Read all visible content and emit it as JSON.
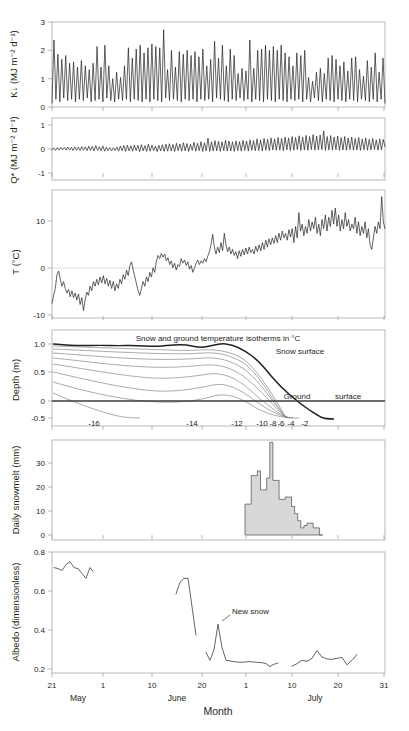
{
  "figure": {
    "xaxis": {
      "title": "Month",
      "ticks": [
        {
          "label": "21",
          "x": 52
        },
        {
          "label": "1",
          "x": 103
        },
        {
          "label": "10",
          "x": 152
        },
        {
          "label": "20",
          "x": 202
        },
        {
          "label": "1",
          "x": 246
        },
        {
          "label": "10",
          "x": 292
        },
        {
          "label": "20",
          "x": 338
        },
        {
          "label": "31",
          "x": 384
        }
      ],
      "months": [
        {
          "label": "May",
          "x": 78
        },
        {
          "label": "June",
          "x": 177
        },
        {
          "label": "July",
          "x": 315
        }
      ]
    },
    "panels": [
      {
        "id": "shortwave",
        "ylabel": "K↓ (MJ m⁻² d⁻¹)",
        "yticks": [
          "0",
          "1",
          "2",
          "3"
        ]
      },
      {
        "id": "netradiation",
        "ylabel": "Q* (MJ m⁻² d⁻¹)",
        "yticks": [
          "-1",
          "0",
          "1"
        ]
      },
      {
        "id": "airtemperature",
        "ylabel": "T (°C)",
        "yticks": [
          "-10",
          "0",
          "10"
        ]
      },
      {
        "id": "depth-isotherms",
        "ylabel": "Depth (m)",
        "yticks": [
          "-0.5",
          "0",
          "0.5",
          "1.0"
        ],
        "caption": "Snow and ground temperature isotherms in °C",
        "labels": {
          "snow_surface": "Snow surface",
          "ground": "Ground",
          "surface": "surface"
        },
        "isotherm_labels": [
          "-16",
          "-14",
          "-12",
          "-10",
          "-8",
          "-6",
          "-4",
          "-2"
        ]
      },
      {
        "id": "snowmelt",
        "ylabel": "Daily snowmelt (mm)",
        "yticks": [
          "0",
          "10",
          "20",
          "30"
        ]
      },
      {
        "id": "albedo",
        "ylabel": "Albedo (dimensionless)",
        "yticks": [
          "0.2",
          "0.4",
          "0.6",
          "0.8"
        ],
        "annotation": "New snow"
      }
    ]
  },
  "chart_data": [
    {
      "type": "line",
      "id": "shortwave",
      "title": "",
      "ylabel": "K↓ (MJ m⁻² d⁻¹)",
      "xlabel": "Month",
      "ylim": [
        0,
        3.3
      ],
      "yticks": [
        0,
        1,
        2,
        3
      ],
      "grid": false,
      "values": [
        0.15,
        2.6,
        0.3,
        2.05,
        0.2,
        1.85,
        0.35,
        2.0,
        0.25,
        1.7,
        0.3,
        1.75,
        0.2,
        1.55,
        0.3,
        1.8,
        0.25,
        1.6,
        0.35,
        1.45,
        0.2,
        1.7,
        0.25,
        2.35,
        0.3,
        1.55,
        0.2,
        2.4,
        0.35,
        1.6,
        0.25,
        1.1,
        0.2,
        1.35,
        0.3,
        1.15,
        0.25,
        1.6,
        0.3,
        2.3,
        0.2,
        1.9,
        0.3,
        2.25,
        0.25,
        2.4,
        0.2,
        2.1,
        0.3,
        2.3,
        0.2,
        2.45,
        0.3,
        2.35,
        0.25,
        2.3,
        0.2,
        3.0,
        0.35,
        1.45,
        0.25,
        2.2,
        0.3,
        1.55,
        0.25,
        2.15,
        0.2,
        2.05,
        0.3,
        2.2,
        0.25,
        2.0,
        0.3,
        2.15,
        0.2,
        1.95,
        0.3,
        2.25,
        0.25,
        1.6,
        0.3,
        1.85,
        0.2,
        2.55,
        0.35,
        1.9,
        0.3,
        2.4,
        0.25,
        1.6,
        0.2,
        2.25,
        0.3,
        2.0,
        0.25,
        1.3,
        0.35,
        1.5,
        0.25,
        1.4,
        0.3,
        2.6,
        0.2,
        1.5,
        0.3,
        2.2,
        0.25,
        2.25,
        0.2,
        2.4,
        0.3,
        2.2,
        0.25,
        2.35,
        0.2,
        2.2,
        0.3,
        2.4,
        0.25,
        2.1,
        0.2,
        1.95,
        0.3,
        1.6,
        0.25,
        2.1,
        0.3,
        2.0,
        0.2,
        2.2,
        0.3,
        1.15,
        0.2,
        1.0,
        0.35,
        1.35,
        0.25,
        1.5,
        0.2,
        1.3,
        0.3,
        1.9,
        0.25,
        2.0,
        0.2,
        1.85,
        0.3,
        1.6,
        0.25,
        1.75,
        0.2,
        1.4,
        0.3,
        1.9,
        0.25,
        1.95,
        0.2,
        1.45,
        0.3,
        1.2,
        0.25,
        1.8,
        0.2,
        1.55,
        0.3,
        2.1,
        0.2,
        1.35,
        0.3,
        1.9,
        0.15
      ],
      "xrange_px": [
        52,
        385
      ]
    },
    {
      "type": "line",
      "id": "netradiation",
      "ylabel": "Q* (MJ m⁻² d⁻¹)",
      "xlabel": "Month",
      "ylim": [
        -1,
        1
      ],
      "yticks": [
        -1,
        0,
        1
      ],
      "grid": false,
      "values": [
        -0.04,
        0.05,
        -0.06,
        0.06,
        -0.05,
        0.07,
        -0.04,
        0.06,
        -0.05,
        0.08,
        -0.05,
        0.07,
        -0.06,
        0.09,
        -0.05,
        0.08,
        -0.06,
        0.1,
        -0.05,
        0.09,
        -0.07,
        0.12,
        -0.06,
        0.11,
        -0.08,
        0.14,
        -0.06,
        0.1,
        -0.07,
        0.13,
        -0.09,
        0.08,
        -0.07,
        0.06,
        -0.08,
        0.05,
        -0.06,
        0.08,
        -0.09,
        0.12,
        -0.07,
        0.14,
        -0.1,
        0.16,
        -0.08,
        0.13,
        -0.09,
        0.17,
        -0.07,
        0.15,
        -0.11,
        0.18,
        -0.08,
        0.14,
        -0.1,
        0.2,
        -0.09,
        0.16,
        -0.07,
        0.12,
        -0.11,
        0.15,
        -0.08,
        0.18,
        -0.1,
        0.2,
        -0.09,
        0.22,
        -0.08,
        0.19,
        -0.1,
        0.24,
        -0.07,
        0.21,
        -0.09,
        0.26,
        -0.08,
        0.23,
        -0.1,
        0.2,
        -0.06,
        0.28,
        -0.09,
        0.24,
        -0.07,
        0.3,
        -0.1,
        0.26,
        -0.08,
        0.45,
        -0.1,
        0.3,
        -0.09,
        0.35,
        -0.08,
        0.32,
        -0.1,
        0.3,
        -0.07,
        0.36,
        -0.09,
        0.33,
        -0.08,
        0.3,
        -0.1,
        0.34,
        -0.07,
        0.31,
        -0.09,
        0.36,
        -0.06,
        0.33,
        -0.08,
        0.38,
        -0.05,
        0.35,
        -0.07,
        0.42,
        -0.06,
        0.38,
        -0.08,
        0.44,
        -0.05,
        0.4,
        -0.07,
        0.46,
        -0.04,
        0.42,
        -0.06,
        0.48,
        -0.05,
        0.44,
        -0.07,
        0.5,
        -0.04,
        0.46,
        -0.06,
        0.52,
        -0.05,
        0.48,
        -0.03,
        0.55,
        -0.06,
        0.5,
        -0.04,
        0.57,
        -0.05,
        0.52,
        -0.02,
        0.6,
        -0.05,
        0.54,
        -0.04,
        0.58,
        -0.03,
        0.75,
        -0.06,
        0.52,
        -0.04,
        0.56,
        -0.05,
        0.5,
        -0.03,
        0.54,
        -0.06,
        0.48,
        -0.04,
        0.52,
        -0.05,
        0.46,
        -0.03,
        0.5,
        -0.05,
        0.44,
        -0.04,
        0.48,
        -0.06,
        0.42,
        -0.03,
        0.46,
        -0.05,
        0.4,
        -0.04,
        0.44,
        -0.02,
        0.38,
        -0.05,
        0.42,
        -0.03,
        0.4,
        0.1
      ],
      "xrange_px": [
        52,
        385
      ]
    },
    {
      "type": "line",
      "id": "airtemperature",
      "ylabel": "T (°C)",
      "xlabel": "Month",
      "ylim": [
        -13,
        14
      ],
      "yticks": [
        -10,
        0,
        10
      ],
      "grid": false,
      "zero_reference": 0,
      "values": [
        -10.2,
        -8.5,
        -7.0,
        -4.0,
        -3.2,
        -5.0,
        -6.5,
        -5.5,
        -7.0,
        -8.0,
        -7.2,
        -8.8,
        -7.5,
        -9.0,
        -8.0,
        -9.5,
        -8.2,
        -10.5,
        -9.0,
        -11.8,
        -9.5,
        -7.8,
        -8.5,
        -6.5,
        -7.5,
        -5.5,
        -6.5,
        -5.0,
        -6.2,
        -4.5,
        -5.8,
        -4.2,
        -6.0,
        -4.8,
        -6.5,
        -5.2,
        -7.0,
        -5.5,
        -7.5,
        -6.0,
        -7.0,
        -5.0,
        -6.0,
        -4.0,
        -5.0,
        -3.0,
        -4.2,
        -2.0,
        -1.2,
        -3.0,
        -4.5,
        -6.0,
        -7.5,
        -8.5,
        -7.0,
        -5.5,
        -6.5,
        -4.5,
        -5.5,
        -3.5,
        -4.5,
        -2.5,
        -3.5,
        -1.0,
        0.2,
        -0.5,
        0.6,
        -0.2,
        0.5,
        -1.0,
        -0.3,
        -1.8,
        -1.0,
        -2.5,
        -1.5,
        -3.0,
        -1.8,
        -2.2,
        -0.5,
        -1.5,
        -0.8,
        -2.0,
        -1.2,
        -2.8,
        -2.0,
        -3.5,
        -2.5,
        -1.5,
        -0.8,
        -1.8,
        -1.0,
        -1.5,
        -0.5,
        -1.2,
        0.0,
        1.0,
        2.5,
        4.8,
        2.0,
        0.5,
        2.0,
        0.8,
        3.0,
        1.2,
        5.0,
        2.5,
        1.0,
        2.0,
        0.5,
        1.5,
        0.2,
        1.0,
        -0.5,
        1.2,
        0.0,
        1.5,
        0.3,
        1.8,
        0.5,
        2.0,
        0.8,
        1.5,
        0.5,
        2.2,
        1.0,
        2.5,
        1.2,
        3.0,
        1.5,
        3.5,
        2.0,
        3.8,
        2.5,
        4.0,
        2.8,
        4.5,
        3.0,
        5.0,
        3.5,
        5.5,
        4.0,
        5.0,
        3.5,
        5.8,
        4.2,
        6.0,
        3.0,
        6.5,
        4.0,
        9.5,
        5.5,
        7.0,
        4.5,
        6.5,
        5.0,
        8.0,
        5.5,
        7.5,
        6.0,
        8.5,
        5.0,
        7.0,
        4.5,
        8.0,
        6.0,
        9.0,
        5.5,
        8.5,
        6.5,
        10.0,
        7.0,
        10.5,
        6.5,
        9.0,
        5.5,
        8.0,
        6.0,
        9.5,
        6.5,
        8.0,
        5.5,
        7.0,
        6.0,
        8.5,
        5.0,
        7.5,
        4.5,
        6.5,
        5.0,
        7.5,
        4.0,
        6.0,
        2.5,
        1.5,
        4.0,
        6.5,
        5.0,
        7.5,
        6.0,
        13.0,
        7.5,
        6.0
      ],
      "xrange_px": [
        52,
        385
      ]
    },
    {
      "type": "area",
      "id": "depth-isotherms",
      "ylabel": "Depth (m)",
      "xlabel": "Month",
      "ylim": [
        -0.5,
        1.15
      ],
      "yticks": [
        -0.5,
        0,
        0.5,
        1.0
      ],
      "caption": "Snow and ground temperature isotherms in °C",
      "isotherms": [
        -16,
        -14,
        -12,
        -10,
        -8,
        -6,
        -4,
        -2
      ],
      "snow_surface_label": "Snow surface",
      "ground_surface_label": "Ground surface",
      "grid": false
    },
    {
      "type": "bar",
      "id": "snowmelt",
      "ylabel": "Daily snowmelt (mm)",
      "xlabel": "Month",
      "ylim": [
        0,
        40
      ],
      "yticks": [
        0,
        10,
        20,
        30
      ],
      "grid": false,
      "start_x_px": 245,
      "values": [
        13,
        13,
        25,
        25,
        27,
        19,
        19,
        24,
        39,
        23,
        23,
        15,
        15,
        16,
        16,
        12,
        9,
        6,
        3,
        4,
        5,
        5,
        3,
        3,
        0
      ],
      "bar_width_px": 3.1
    },
    {
      "type": "line",
      "id": "albedo",
      "ylabel": "Albedo (dimensionless)",
      "xlabel": "Month",
      "ylim": [
        0.18,
        0.8
      ],
      "yticks": [
        0.2,
        0.4,
        0.6,
        0.8
      ],
      "grid": false,
      "annotation": "New snow",
      "segments": [
        {
          "x_px": [
            54,
            58,
            62,
            66,
            70,
            74,
            78,
            82,
            86,
            90,
            93
          ],
          "values": [
            0.72,
            0.715,
            0.705,
            0.735,
            0.75,
            0.72,
            0.715,
            0.69,
            0.665,
            0.72,
            0.7
          ]
        },
        {
          "x_px": [
            176,
            180,
            184,
            188,
            192,
            196
          ],
          "values": [
            0.585,
            0.645,
            0.665,
            0.665,
            0.52,
            0.375
          ]
        },
        {
          "x_px": [
            206,
            210,
            214,
            218,
            222,
            226,
            230,
            234,
            238,
            242,
            246,
            250,
            254,
            258,
            262,
            266,
            270,
            274,
            278
          ],
          "values": [
            0.285,
            0.245,
            0.3,
            0.43,
            0.31,
            0.245,
            0.242,
            0.238,
            0.236,
            0.235,
            0.237,
            0.238,
            0.236,
            0.234,
            0.233,
            0.228,
            0.213,
            0.225,
            0.232
          ]
        },
        {
          "x_px": [
            292,
            297,
            302,
            307,
            312,
            317,
            322,
            327,
            332,
            337,
            342,
            347,
            352,
            357
          ],
          "values": [
            0.215,
            0.228,
            0.245,
            0.24,
            0.255,
            0.295,
            0.262,
            0.252,
            0.25,
            0.255,
            0.26,
            0.222,
            0.245,
            0.275
          ]
        }
      ]
    }
  ]
}
